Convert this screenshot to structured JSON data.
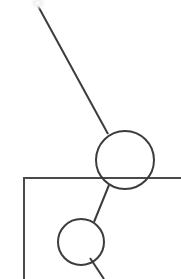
{
  "canvas": {
    "width": 181,
    "height": 279,
    "background_color": "#ffffff",
    "stroke_color": "#3c3c3c",
    "stroke_width": 2,
    "description": "node-link diagram fragment"
  },
  "nodes": [
    {
      "id": "node-large",
      "name": "large-node-circle",
      "cx": 125,
      "cy": 160,
      "r": 29,
      "stroke": "#3c3c3c",
      "stroke_width": 2,
      "fill": "none"
    },
    {
      "id": "node-small",
      "name": "small-node-circle",
      "cx": 81,
      "cy": 242,
      "r": 23,
      "stroke": "#3c3c3c",
      "stroke_width": 2,
      "fill": "none"
    }
  ],
  "edges": [
    {
      "id": "edge-upper",
      "name": "edge-upper-left-to-large-node",
      "x1": 38,
      "y1": 6,
      "x2": 108,
      "y2": 134,
      "stroke": "#3c3c3c",
      "stroke_width": 2
    },
    {
      "id": "edge-between",
      "name": "edge-large-node-to-small-node",
      "x1": 109,
      "y1": 185,
      "x2": 94,
      "y2": 222,
      "stroke": "#3c3c3c",
      "stroke_width": 2
    },
    {
      "id": "edge-lower",
      "name": "edge-small-node-to-lower-right",
      "x1": 90,
      "y1": 258,
      "x2": 104,
      "y2": 279,
      "stroke": "#3c3c3c",
      "stroke_width": 2
    }
  ],
  "frame": {
    "name": "frame-corner-lines",
    "corner_x": 24,
    "corner_y": 178,
    "horizontal_end_x": 181,
    "vertical_end_y": 279,
    "stroke": "#4a4a4a",
    "stroke_width": 2
  },
  "highlight_blob": {
    "name": "light-highlight-blob",
    "cx": 38,
    "cy": 3,
    "rx": 9,
    "ry": 7,
    "color": "#f2f2f2"
  }
}
